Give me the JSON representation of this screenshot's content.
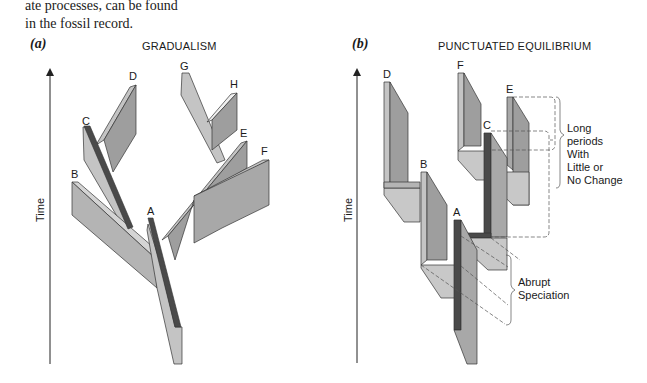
{
  "caption": {
    "line1": "ate processes, can be found",
    "line2": "in the fossil record."
  },
  "panel_a": {
    "letter": "(a)",
    "title": "GRADUALISM",
    "axis_label": "Time",
    "branch_labels": [
      "A",
      "B",
      "C",
      "D",
      "E",
      "F",
      "G",
      "H"
    ]
  },
  "panel_b": {
    "letter": "(b)",
    "title": "PUNCTUATED EQUILIBRIUM",
    "axis_label": "Time",
    "branch_labels": [
      "A",
      "B",
      "C",
      "D",
      "E",
      "F"
    ],
    "annotation_long": [
      "Long",
      "periods",
      "With",
      "Little or",
      "No Change"
    ],
    "annotation_abrupt": [
      "Abrupt",
      "Speciation"
    ]
  },
  "colors": {
    "light_face": "#c4c4c4",
    "mid_face": "#a8a8a8",
    "dark_face": "#8c8c8c",
    "highlight": "#4a4a4a",
    "outline": "#333333"
  }
}
